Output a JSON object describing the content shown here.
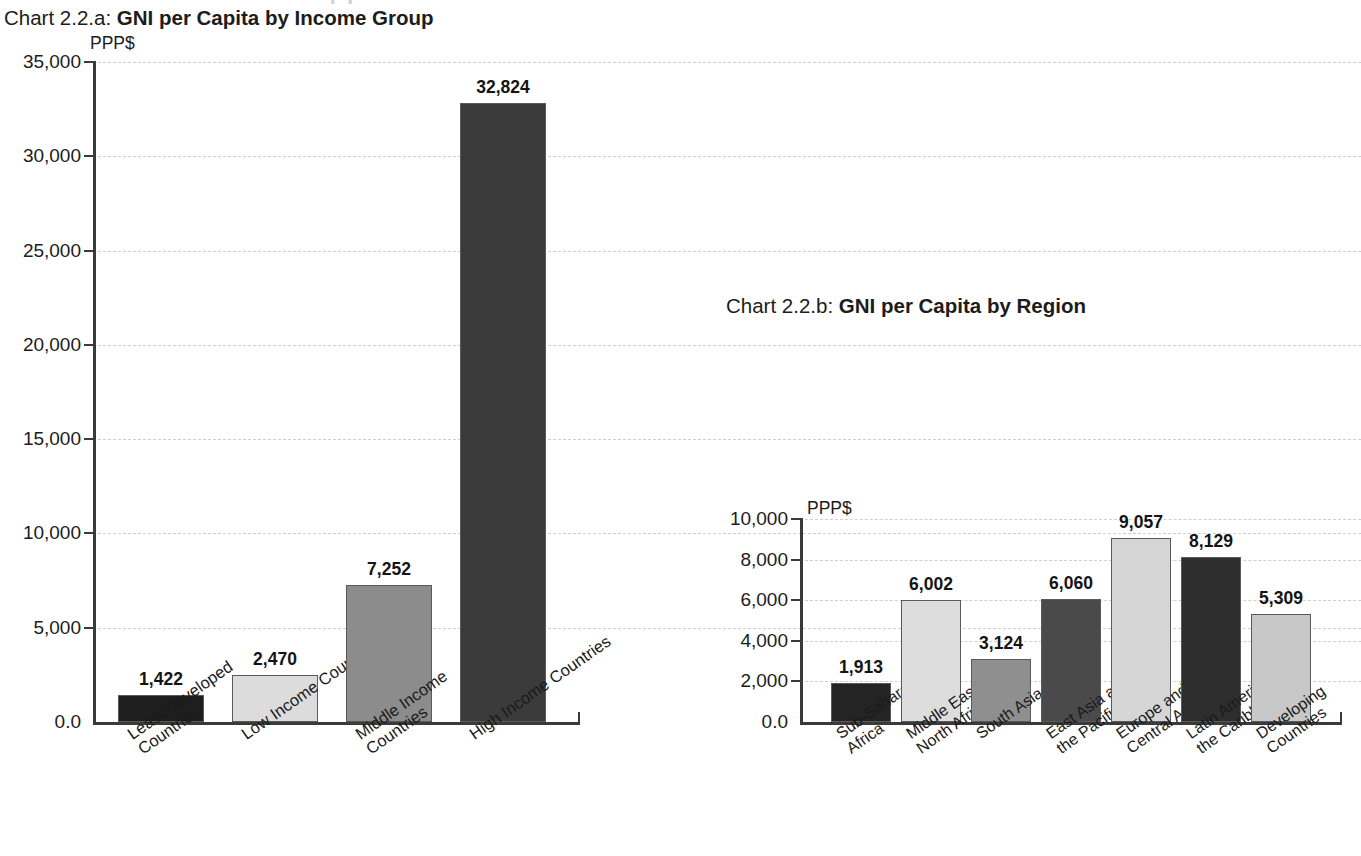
{
  "page": {
    "clipped_header_remnant": "( )"
  },
  "chart_a": {
    "title_lead": "Chart 2.2.a:",
    "title_strong": "GNI per Capita by Income Group",
    "unit": "PPP$",
    "y_ticks": [
      "35,000",
      "30,000",
      "25,000",
      "20,000",
      "15,000",
      "10,000",
      "5,000",
      "0.0"
    ],
    "bars": [
      {
        "label_line1": "Least Developed",
        "label_line2": "Countries",
        "value_text": "1,422",
        "color": "#1e1e1e"
      },
      {
        "label_line1": "Low Income Countries",
        "label_line2": "",
        "value_text": "2,470",
        "color": "#dcdcdc"
      },
      {
        "label_line1": "Middle Income",
        "label_line2": "Countries",
        "value_text": "7,252",
        "color": "#8c8c8c"
      },
      {
        "label_line1": "High Income Countries",
        "label_line2": "",
        "value_text": "32,824",
        "color": "#3b3b3b"
      }
    ]
  },
  "chart_b": {
    "title_lead": "Chart 2.2.b:",
    "title_strong": "GNI per Capita by Region",
    "unit": "PPP$",
    "y_ticks": [
      "10,000",
      "8,000",
      "6,000",
      "4,000",
      "2,000",
      "0.0"
    ],
    "bars": [
      {
        "label_line1": "Sub-Saharan",
        "label_line2": "Africa",
        "value_text": "1,913",
        "color": "#242424"
      },
      {
        "label_line1": "Middle East and",
        "label_line2": "North Africa",
        "value_text": "6,002",
        "color": "#dddddd"
      },
      {
        "label_line1": "South Asia",
        "label_line2": "",
        "value_text": "3,124",
        "color": "#8f8f8f"
      },
      {
        "label_line1": "East Asia and",
        "label_line2": "the Pacific",
        "value_text": "6,060",
        "color": "#4a4a4a"
      },
      {
        "label_line1": "Europe and",
        "label_line2": "Central Asia",
        "value_text": "9,057",
        "color": "#d5d5d5"
      },
      {
        "label_line1": "Latin America and",
        "label_line2": "the Caribbean",
        "value_text": "8,129",
        "color": "#2e2e2e"
      },
      {
        "label_line1": "Developing",
        "label_line2": "Countries",
        "value_text": "5,309",
        "color": "#c8c8c8"
      }
    ]
  },
  "chart_data": [
    {
      "type": "bar",
      "id": "chart-2.2.a",
      "title": "Chart 2.2.a: GNI per Capita by Income Group",
      "xlabel": "",
      "ylabel": "PPP$",
      "ylim": [
        0,
        35000
      ],
      "ytick_values": [
        0,
        5000,
        10000,
        15000,
        20000,
        25000,
        30000,
        35000
      ],
      "ytick_labels": [
        "0.0",
        "5,000",
        "10,000",
        "15,000",
        "20,000",
        "25,000",
        "30,000",
        "35,000"
      ],
      "grid": true,
      "legend": "none",
      "categories": [
        "Least Developed Countries",
        "Low Income Countries",
        "Middle Income Countries",
        "High Income Countries"
      ],
      "values": [
        1422,
        2470,
        7252,
        32824
      ],
      "data_labels": [
        "1,422",
        "2,470",
        "7,252",
        "32,824"
      ],
      "bar_colors": [
        "#1e1e1e",
        "#dcdcdc",
        "#8c8c8c",
        "#3b3b3b"
      ]
    },
    {
      "type": "bar",
      "id": "chart-2.2.b",
      "title": "Chart 2.2.b: GNI per Capita by Region",
      "xlabel": "",
      "ylabel": "PPP$",
      "ylim": [
        0,
        10000
      ],
      "ytick_values": [
        0,
        2000,
        4000,
        6000,
        8000,
        10000
      ],
      "ytick_labels": [
        "0.0",
        "2,000",
        "4,000",
        "6,000",
        "8,000",
        "10,000"
      ],
      "grid": true,
      "legend": "none",
      "categories": [
        "Sub-Saharan Africa",
        "Middle East and North Africa",
        "South Asia",
        "East Asia and the Pacific",
        "Europe and Central Asia",
        "Latin America and the Caribbean",
        "Developing Countries"
      ],
      "values": [
        1913,
        6002,
        3124,
        6060,
        9057,
        8129,
        5309
      ],
      "data_labels": [
        "1,913",
        "6,002",
        "3,124",
        "6,060",
        "9,057",
        "8,129",
        "5,309"
      ],
      "bar_colors": [
        "#242424",
        "#dddddd",
        "#8f8f8f",
        "#4a4a4a",
        "#d5d5d5",
        "#2e2e2e",
        "#c8c8c8"
      ]
    }
  ]
}
